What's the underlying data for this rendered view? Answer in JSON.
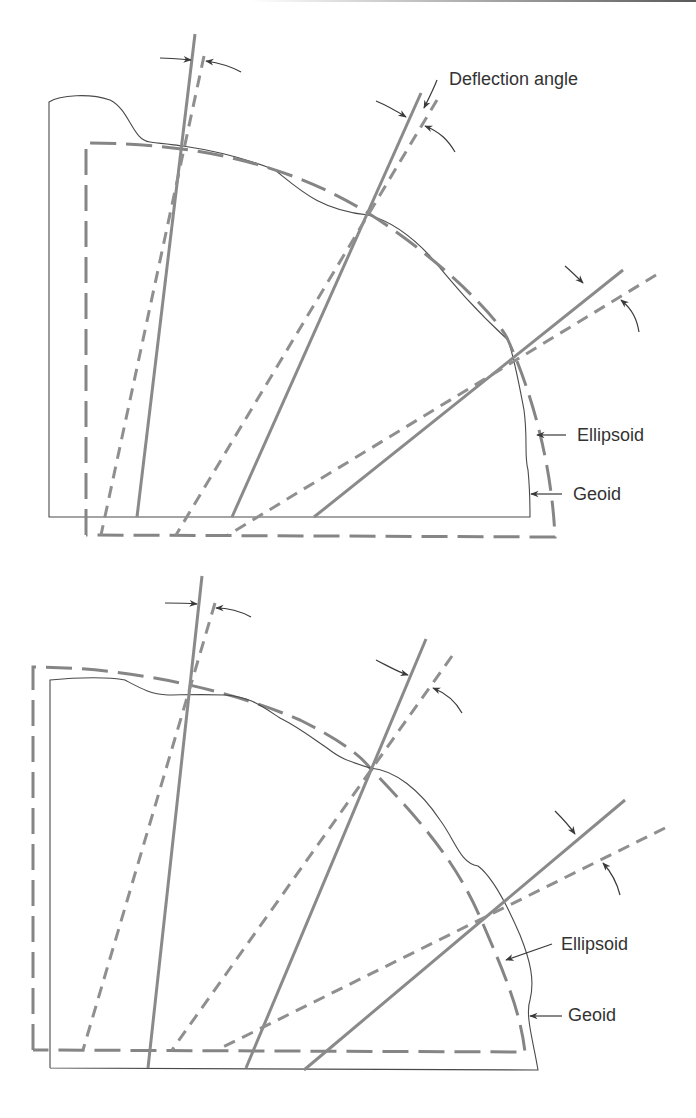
{
  "figure": {
    "top_panel": {
      "labels": {
        "deflection": "Deflection angle",
        "ellipsoid": "Ellipsoid",
        "geoid": "Geoid"
      }
    },
    "bottom_panel": {
      "labels": {
        "ellipsoid": "Ellipsoid",
        "geoid": "Geoid"
      }
    },
    "legend_semantics": {
      "solid_thin": "Geoid surface",
      "dashed_thick": "Ellipsoid surface",
      "solid_thick": "Plumb line (vertical)",
      "dashed_medium": "Ellipsoid normal"
    },
    "colors": {
      "geoid_stroke": "#4a4a4a",
      "ellipsoid_stroke": "#858585",
      "line_stroke": "#8a8a8a",
      "arrow_stroke": "#3a3a3a",
      "text": "#333333"
    }
  }
}
